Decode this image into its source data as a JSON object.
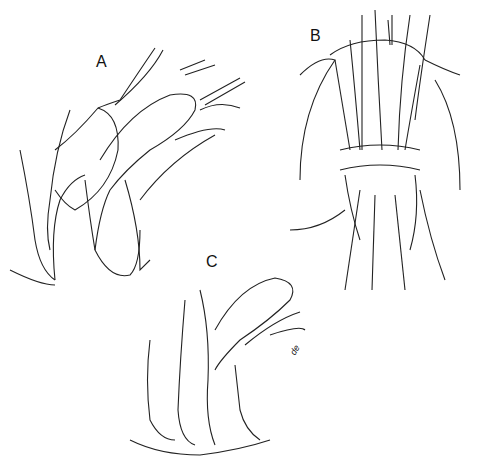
{
  "figure": {
    "panels": [
      {
        "id": "A",
        "label": "A",
        "description": "Lateral view, sutures placed through tissue flap"
      },
      {
        "id": "B",
        "label": "B",
        "description": "Frontal view with multiple traction sutures"
      },
      {
        "id": "C",
        "label": "C",
        "description": "Lateral view after repair"
      }
    ],
    "signature": "de"
  }
}
